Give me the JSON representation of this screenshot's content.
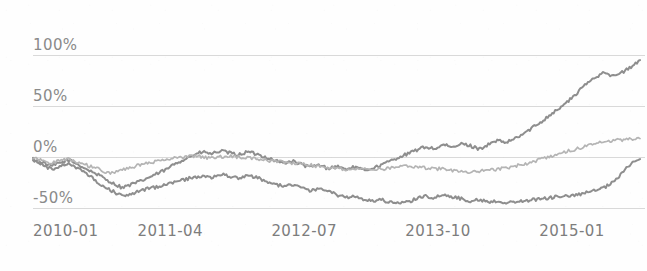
{
  "chart_data": {
    "type": "line",
    "title": "",
    "subtitle": "",
    "xlabel": "",
    "ylabel": "",
    "ylim": [
      -62,
      112
    ],
    "xlim": [
      0,
      62
    ],
    "grid": true,
    "legend": "none",
    "y_ticks": [
      {
        "value": 100,
        "label": "100%"
      },
      {
        "value": 50,
        "label": "50%"
      },
      {
        "value": 0,
        "label": "0%"
      },
      {
        "value": -50,
        "label": "-50%"
      }
    ],
    "x_ticks": [
      {
        "index": 0,
        "label": "2010-01"
      },
      {
        "index": 15,
        "label": "2011-04"
      },
      {
        "index": 30,
        "label": "2012-07"
      },
      {
        "index": 45,
        "label": "2013-10"
      },
      {
        "index": 60,
        "label": "2015-01"
      }
    ],
    "series": [
      {
        "name": "series-1",
        "color": "#8e8e8e",
        "values": [
          -2,
          -5,
          -9,
          -6,
          -3,
          -7,
          -12,
          -16,
          -21,
          -26,
          -30,
          -27,
          -24,
          -20,
          -16,
          -12,
          -6,
          -2,
          2,
          5,
          3,
          6,
          4,
          2,
          5,
          3,
          0,
          -3,
          -6,
          -4,
          -7,
          -10,
          -8,
          -11,
          -9,
          -12,
          -10,
          -13,
          -11,
          -8,
          -4,
          0,
          3,
          7,
          10,
          8,
          12,
          9,
          13,
          11,
          8,
          12,
          16,
          14,
          18,
          23,
          29,
          35,
          42,
          48,
          55,
          63,
          72,
          78,
          84,
          79,
          83,
          88,
          95
        ]
      },
      {
        "name": "series-2",
        "color": "#b4b4b4",
        "values": [
          -1,
          -3,
          -6,
          -4,
          -2,
          -5,
          -8,
          -11,
          -14,
          -16,
          -13,
          -10,
          -8,
          -6,
          -4,
          -2,
          -1,
          0,
          1,
          0,
          -1,
          0,
          1,
          0,
          -1,
          -2,
          -3,
          -4,
          -5,
          -6,
          -7,
          -8,
          -9,
          -10,
          -11,
          -12,
          -11,
          -12,
          -13,
          -12,
          -11,
          -10,
          -9,
          -10,
          -11,
          -12,
          -11,
          -13,
          -14,
          -15,
          -14,
          -13,
          -12,
          -11,
          -9,
          -7,
          -5,
          -2,
          1,
          3,
          6,
          8,
          11,
          13,
          15,
          16,
          17,
          18,
          18
        ]
      },
      {
        "name": "series-3",
        "color": "#8e8e8e",
        "values": [
          -3,
          -7,
          -12,
          -9,
          -6,
          -11,
          -17,
          -23,
          -29,
          -34,
          -38,
          -36,
          -33,
          -31,
          -29,
          -27,
          -24,
          -22,
          -20,
          -18,
          -20,
          -17,
          -19,
          -21,
          -18,
          -20,
          -23,
          -26,
          -29,
          -27,
          -30,
          -33,
          -31,
          -34,
          -37,
          -40,
          -38,
          -41,
          -43,
          -42,
          -44,
          -46,
          -44,
          -41,
          -38,
          -40,
          -37,
          -39,
          -41,
          -43,
          -42,
          -44,
          -43,
          -45,
          -44,
          -43,
          -42,
          -41,
          -40,
          -38,
          -39,
          -37,
          -35,
          -33,
          -30,
          -25,
          -16,
          -6,
          -2
        ]
      }
    ]
  },
  "axes": {
    "y_axis_name": "percent-change-axis",
    "x_axis_name": "date-axis"
  }
}
